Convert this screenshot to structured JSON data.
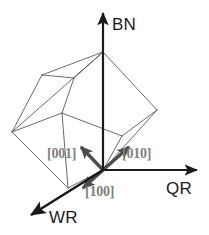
{
  "figure": {
    "type": "3d-axes-crystal-orientation-diagram",
    "width": 209,
    "height": 235,
    "background_color": "#ffffff"
  },
  "axes": {
    "origin": {
      "x": 103,
      "y": 170
    },
    "items": [
      {
        "id": "bn",
        "label": "BN",
        "color": "#1a1a1a",
        "stroke_width": 2.2,
        "from": {
          "x": 103,
          "y": 170
        },
        "to": {
          "x": 103,
          "y": 13
        },
        "arrowhead": true
      },
      {
        "id": "qr",
        "label": "QR",
        "color": "#1a1a1a",
        "stroke_width": 2.2,
        "from": {
          "x": 103,
          "y": 170
        },
        "to": {
          "x": 197,
          "y": 170
        },
        "arrowhead": true
      },
      {
        "id": "wr",
        "label": "WR",
        "color": "#1a1a1a",
        "stroke_width": 2.6,
        "from": {
          "x": 103,
          "y": 170
        },
        "to": {
          "x": 31,
          "y": 215
        },
        "arrowhead": true
      }
    ]
  },
  "directions": {
    "color": "#4d4d4d",
    "label_color": "#808080",
    "stroke_width": 3.4,
    "items": [
      {
        "id": "001",
        "label": "[001]",
        "from": {
          "x": 103,
          "y": 170
        },
        "to": {
          "x": 81,
          "y": 147
        }
      },
      {
        "id": "010",
        "label": "[010]",
        "from": {
          "x": 103,
          "y": 170
        },
        "to": {
          "x": 129,
          "y": 147
        }
      },
      {
        "id": "100",
        "label": "[100]",
        "from": {
          "x": 103,
          "y": 170
        },
        "to": {
          "x": 83,
          "y": 188
        }
      }
    ]
  },
  "cube": {
    "description": "tilted cube wireframe",
    "stroke_color": "#5a5a5a",
    "stroke_width": 0.9,
    "vertices": {
      "top": {
        "x": 103,
        "y": 52
      },
      "upper_left": {
        "x": 42,
        "y": 75
      },
      "right": {
        "x": 157,
        "y": 110
      },
      "left": {
        "x": 12,
        "y": 132
      },
      "inner_top": {
        "x": 74,
        "y": 78
      },
      "inner_mid": {
        "x": 62,
        "y": 113
      },
      "inner_right": {
        "x": 122,
        "y": 136
      },
      "bottom_front": {
        "x": 103,
        "y": 170
      },
      "bottom_left": {
        "x": 68,
        "y": 188
      },
      "lower_mid": {
        "x": 37,
        "y": 156
      }
    },
    "edges": [
      [
        "top",
        "left"
      ],
      [
        "top",
        "right"
      ],
      [
        "top",
        "upper_left"
      ],
      [
        "upper_left",
        "left"
      ],
      [
        "upper_left",
        "inner_top"
      ],
      [
        "inner_top",
        "top"
      ],
      [
        "inner_top",
        "inner_mid"
      ],
      [
        "inner_mid",
        "left"
      ],
      [
        "inner_mid",
        "inner_right"
      ],
      [
        "inner_right",
        "right"
      ],
      [
        "inner_right",
        "bottom_front"
      ],
      [
        "right",
        "bottom_front"
      ],
      [
        "left",
        "bottom_left"
      ],
      [
        "bottom_left",
        "bottom_front"
      ],
      [
        "inner_mid",
        "bottom_left"
      ]
    ]
  }
}
